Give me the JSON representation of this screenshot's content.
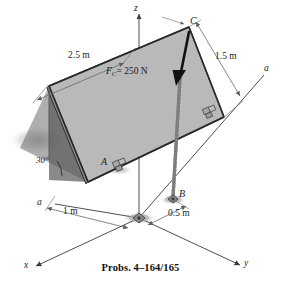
{
  "figure": {
    "caption": "Probs. 4–164/165",
    "axes": {
      "z_label": "z",
      "x_label": "x",
      "y_label": "y"
    },
    "points": {
      "a_label": "A",
      "b_label": "B",
      "c_label": "C"
    },
    "section_labels": {
      "left": "a",
      "right": "a"
    },
    "dimensions": {
      "plate_length": "2.5 m",
      "plate_width": "1.5 m",
      "x_offset": "1 m",
      "y_offset": "0.5 m",
      "incline_angle": "30°"
    },
    "force": {
      "symbol": "F",
      "subscript": "C",
      "equals_value": "= 250 N",
      "full_label": "F_C = 250 N"
    },
    "colors": {
      "plate_fill": "#b9b9b9",
      "plate_edge": "#2b2b2b",
      "shadow_fill": "#6e6e6e",
      "ground_shadow": "#c9c9c9",
      "cable": "#8c8c8c",
      "arrow": "#111111",
      "axis_line": "#3a3a3a",
      "dimension_line": "#6a6a6a",
      "text": "#1a1a1a"
    }
  }
}
